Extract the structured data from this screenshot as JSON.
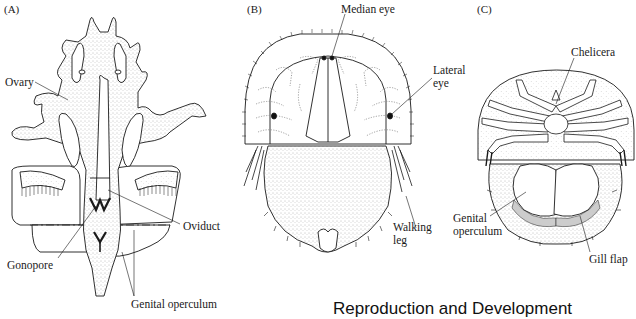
{
  "figure": {
    "panels": [
      {
        "id": "A",
        "letter": "(A)",
        "labels": {
          "ovary": "Ovary",
          "oviduct": "Oviduct",
          "gonopore": "Gonopore",
          "genital_operculum": "Genital operculum"
        }
      },
      {
        "id": "B",
        "letter": "(B)",
        "labels": {
          "median_eye": "Median eye",
          "lateral_eye_1": "Lateral",
          "lateral_eye_2": "eye",
          "walking_leg_1": "Walking",
          "walking_leg_2": "leg"
        }
      },
      {
        "id": "C",
        "letter": "(C)",
        "labels": {
          "chelicera": "Chelicera",
          "genital_operculum_1": "Genital",
          "genital_operculum_2": "operculum",
          "gill_flap": "Gill flap"
        }
      }
    ],
    "caption": "Reproduction and Development",
    "colors": {
      "ink": "#1a1a1a",
      "stipple": "#bdbdbd",
      "background": "#ffffff"
    }
  }
}
